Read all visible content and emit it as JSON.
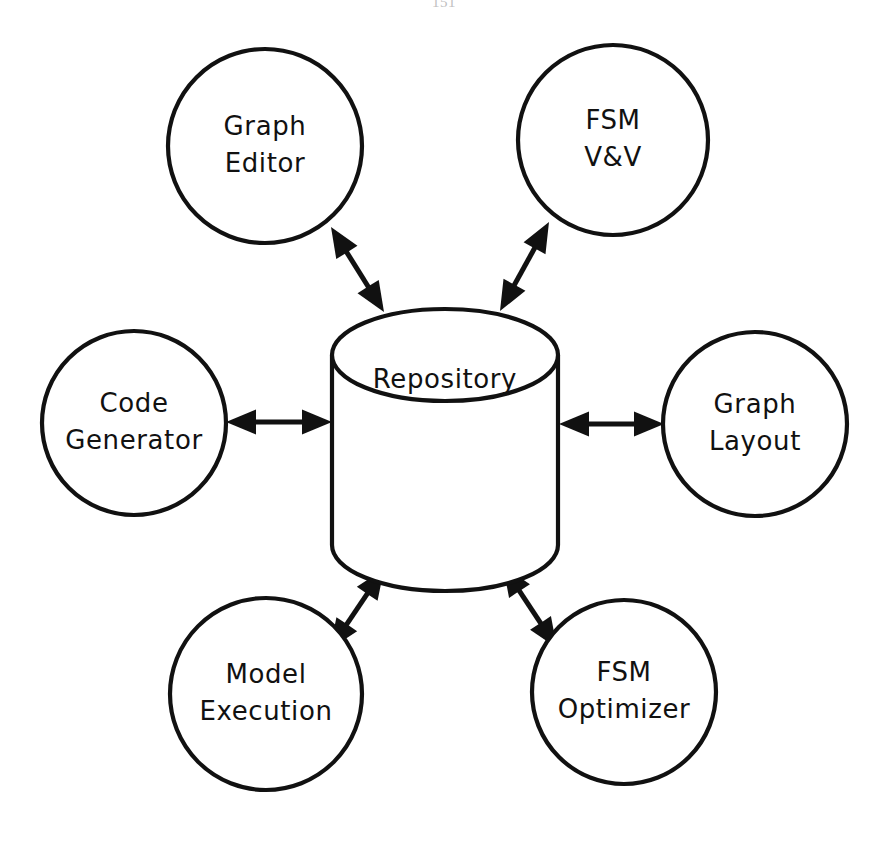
{
  "page": {
    "page_number": "151",
    "background_color": "#ffffff",
    "ink_color": "#111111"
  },
  "diagram": {
    "type": "hub-and-spoke architecture diagram",
    "center": {
      "id": "repository",
      "label": "Repository",
      "shape": "cylinder",
      "cx": 445,
      "cy": 448,
      "rx": 113,
      "body_top": 355,
      "body_bottom": 545,
      "lid_ry": 46,
      "label_dy": -68
    },
    "nodes": [
      {
        "id": "graph-editor",
        "shape": "circle",
        "cx": 265,
        "cy": 146,
        "r": 97,
        "lines": [
          "Graph",
          "Editor"
        ],
        "font_size": 26
      },
      {
        "id": "fsm-vv",
        "shape": "circle",
        "cx": 613,
        "cy": 140,
        "r": 95,
        "lines": [
          "FSM",
          "V&V"
        ],
        "font_size": 26
      },
      {
        "id": "code-generator",
        "shape": "circle",
        "cx": 134,
        "cy": 423,
        "r": 92,
        "lines": [
          "Code",
          "Generator"
        ],
        "font_size": 26
      },
      {
        "id": "graph-layout",
        "shape": "circle",
        "cx": 755,
        "cy": 424,
        "r": 92,
        "lines": [
          "Graph",
          "Layout"
        ],
        "font_size": 26
      },
      {
        "id": "model-execution",
        "shape": "circle",
        "cx": 266,
        "cy": 694,
        "r": 96,
        "lines": [
          "Model",
          "Execution"
        ],
        "font_size": 26
      },
      {
        "id": "fsm-optimizer",
        "shape": "circle",
        "cx": 624,
        "cy": 692,
        "r": 92,
        "lines": [
          "FSM",
          "Optimizer"
        ],
        "font_size": 26
      }
    ],
    "edges": [
      {
        "id": "edge-graph-editor",
        "from": "graph-editor",
        "to": "repository",
        "arrow": "double",
        "x1": 331,
        "y1": 227,
        "x2": 384,
        "y2": 312
      },
      {
        "id": "edge-fsm-vv",
        "from": "fsm-vv",
        "to": "repository",
        "arrow": "double",
        "x1": 549,
        "y1": 222,
        "x2": 500,
        "y2": 311
      },
      {
        "id": "edge-code-generator",
        "from": "code-generator",
        "to": "repository",
        "arrow": "double",
        "x1": 226,
        "y1": 422,
        "x2": 332,
        "y2": 422
      },
      {
        "id": "edge-graph-layout",
        "from": "repository",
        "to": "graph-layout",
        "arrow": "double",
        "x1": 559,
        "y1": 424,
        "x2": 664,
        "y2": 424
      },
      {
        "id": "edge-model-execution",
        "from": "repository",
        "to": "model-execution",
        "arrow": "double",
        "x1": 384,
        "y1": 569,
        "x2": 330,
        "y2": 649
      },
      {
        "id": "edge-fsm-optimizer",
        "from": "repository",
        "to": "fsm-optimizer",
        "arrow": "double",
        "x1": 503,
        "y1": 566,
        "x2": 557,
        "y2": 648
      }
    ]
  }
}
